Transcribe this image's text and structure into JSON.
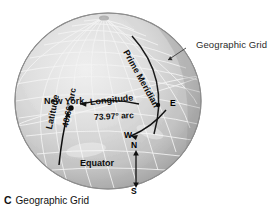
{
  "figure": {
    "caption_letter": "C",
    "caption_text": "Geographic Grid",
    "callout": "Geographic Grid",
    "globe": {
      "fill_light": "#dcdcdc",
      "fill_mid": "#c6c6c6",
      "fill_dark": "#a8a8a8",
      "grid_color": "#f2f2f2",
      "outline_color": "#8f8f8f"
    },
    "labels": {
      "city": "New York",
      "longitude": "Longitude",
      "longitude_arc": "73.97° arc",
      "latitude": "Latitude",
      "latitude_arc": "40.66° arc",
      "prime_meridian": "Prime Meridian",
      "equator": "Equator"
    },
    "compass": {
      "east": "E",
      "west": "W",
      "north": "N",
      "south": "S"
    }
  }
}
